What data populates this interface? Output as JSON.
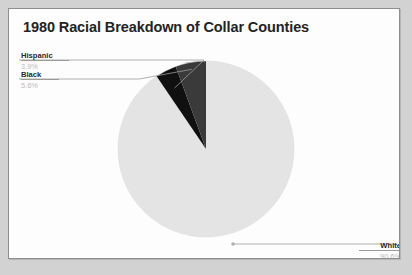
{
  "document": {
    "type": "scanned-slide",
    "page_background": "#d2d2d2",
    "panel_background": "#fdfdfd",
    "panel_border": "#8e8e8e"
  },
  "chart_data": {
    "type": "pie",
    "title": "1980 Racial Breakdown of Collar Counties",
    "xlabel": "",
    "ylabel": "",
    "legend_position": "callout-labels",
    "grid": false,
    "start_angle_deg": 0,
    "direction": "counterclockwise",
    "categories": [
      "Black",
      "Hispanic",
      "White"
    ],
    "values": [
      5.6,
      3.9,
      90.6
    ],
    "unit": "%",
    "slices": [
      {
        "label": "Black",
        "value": 5.6,
        "value_text": "5.6%",
        "color": "#3a3a3a",
        "angle_deg": 20.16
      },
      {
        "label": "Hispanic",
        "value": 3.9,
        "value_text": "3.9%",
        "color": "#101010",
        "angle_deg": 14.04
      },
      {
        "label": "White",
        "value": 90.6,
        "value_text": "90.6%",
        "color": "#e4e4e4",
        "angle_deg": 326.16
      }
    ]
  },
  "callouts": {
    "hispanic": {
      "name": "Hispanic",
      "value": "3.9%"
    },
    "black": {
      "name": "Black",
      "value": "5.6%"
    },
    "white": {
      "name": "White",
      "value": "90.6%"
    }
  },
  "colors": {
    "slice_white": "#e4e4e4",
    "slice_black": "#101010",
    "slice_dark_gray": "#3a3a3a",
    "leader_line": "#9a9a9a",
    "title_text": "#232323",
    "value_text": "#b9b9b9"
  }
}
